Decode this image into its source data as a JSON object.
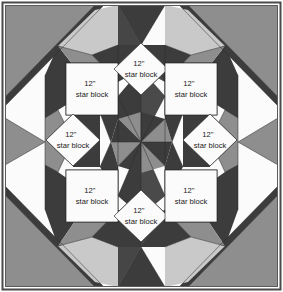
{
  "figure": {
    "name": "quilt-block-layout-diagram",
    "kind": "quilt-setting-diagram",
    "width": 283,
    "height": 292
  },
  "colors": {
    "outline": "#2b2b2b",
    "frame_border": "#4a4a4a",
    "background_white": "#fbfbfb",
    "light_gray": "#c9c9c9",
    "medium_gray": "#8e8e8e",
    "dark_gray": "#3c3c3c",
    "darkest_gray": "#2e2e2e",
    "label_text": "#1a1a1a",
    "page_background": "#ffffff"
  },
  "labels": {
    "size": "12\"",
    "caption": "star block"
  },
  "blocks": [
    {
      "id": "star-block-top-left",
      "size": "12\"",
      "caption": "star block",
      "orientation": "square",
      "row": 0,
      "col": 0,
      "cx": 92,
      "cy": 89
    },
    {
      "id": "star-block-top-center",
      "size": "12\"",
      "caption": "star block",
      "orientation": "diamond",
      "row": 0,
      "col": 1,
      "cx": 141,
      "cy": 69
    },
    {
      "id": "star-block-top-right",
      "size": "12\"",
      "caption": "star block",
      "orientation": "square",
      "row": 0,
      "col": 2,
      "cx": 191,
      "cy": 89
    },
    {
      "id": "star-block-middle-left",
      "size": "12\"",
      "caption": "star block",
      "orientation": "diamond",
      "row": 1,
      "col": 0,
      "cx": 73,
      "cy": 140
    },
    {
      "id": "star-block-middle-right",
      "size": "12\"",
      "caption": "star block",
      "orientation": "diamond",
      "row": 1,
      "col": 2,
      "cx": 210,
      "cy": 140
    },
    {
      "id": "star-block-bottom-left",
      "size": "12\"",
      "caption": "star block",
      "orientation": "square",
      "row": 2,
      "col": 0,
      "cx": 92,
      "cy": 196
    },
    {
      "id": "star-block-bottom-center",
      "size": "12\"",
      "caption": "star block",
      "orientation": "diamond",
      "row": 2,
      "col": 1,
      "cx": 141,
      "cy": 216
    },
    {
      "id": "star-block-bottom-right",
      "size": "12\"",
      "caption": "star block",
      "orientation": "square",
      "row": 2,
      "col": 2,
      "cx": 191,
      "cy": 196
    }
  ],
  "center_pinwheel": {
    "name": "center-pinwheel",
    "cx": 141,
    "cy": 142,
    "wedge_count": 8,
    "shades": [
      "medium",
      "dark",
      "medium",
      "dark",
      "medium",
      "dark",
      "medium",
      "dark"
    ]
  },
  "corners": [
    {
      "id": "corner-top-left",
      "shade": "medium"
    },
    {
      "id": "corner-top-right",
      "shade": "medium"
    },
    {
      "id": "corner-bottom-left",
      "shade": "medium"
    },
    {
      "id": "corner-bottom-right",
      "shade": "medium"
    }
  ]
}
